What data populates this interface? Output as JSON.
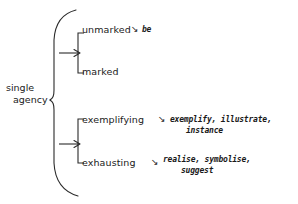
{
  "diagram": {
    "type": "tree-brace-diagram",
    "root": {
      "name": "root-node",
      "line1": "single",
      "line2": "agency"
    },
    "arrow_glyph": "↘",
    "groups": [
      {
        "name": "group-marking",
        "branches": [
          {
            "name": "branch-unmarked",
            "label": "unmarked",
            "gloss_line1": "be",
            "gloss_line2": ""
          },
          {
            "name": "branch-marked",
            "label": "marked",
            "gloss_line1": "",
            "gloss_line2": ""
          }
        ]
      },
      {
        "name": "group-realisation",
        "branches": [
          {
            "name": "branch-exemplifying",
            "label": "exemplifying",
            "gloss_line1": "exemplify, illustrate,",
            "gloss_line2": "instance"
          },
          {
            "name": "branch-exhausting",
            "label": "exhausting",
            "gloss_line1": "realise, symbolise,",
            "gloss_line2": "suggest"
          }
        ]
      }
    ],
    "colors": {
      "ink": "#1a1a1a",
      "background": "#ffffff"
    }
  }
}
